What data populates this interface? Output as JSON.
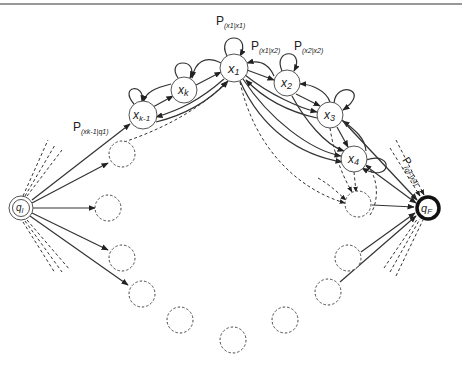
{
  "diagram": {
    "type": "state-transition-graph",
    "nodes": {
      "q_start": {
        "label": "q",
        "sub": "I"
      },
      "q_final": {
        "label": "q",
        "sub": "F"
      },
      "x1": {
        "label": "x",
        "sub": "1"
      },
      "x2": {
        "label": "x",
        "sub": "2"
      },
      "x3": {
        "label": "x",
        "sub": "3"
      },
      "x4": {
        "label": "x",
        "sub": "4"
      },
      "xk": {
        "label": "x",
        "sub": "k"
      },
      "xk1": {
        "label": "x",
        "sub": "k-1"
      }
    },
    "edge_labels": {
      "self_x1": {
        "p": "P",
        "sub": "(x1|x1)"
      },
      "x1_x2": {
        "p": "P",
        "sub": "(x1|x2)"
      },
      "self_x2": {
        "p": "P",
        "sub": "(x2|x2)"
      },
      "start_xk1": {
        "p": "P",
        "sub": "(xk-1|q1)"
      },
      "x4_final": {
        "p": "P",
        "sub": "(qF|x4)"
      }
    },
    "placeholder_nodes_count": 10
  }
}
